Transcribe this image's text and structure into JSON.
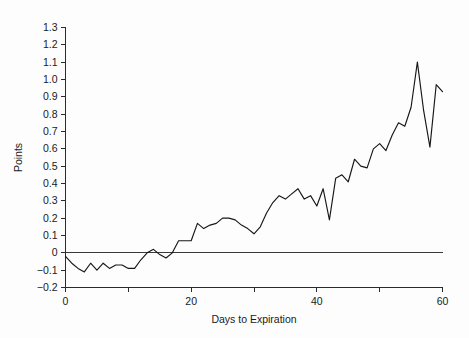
{
  "chart_data": {
    "type": "line",
    "title": "",
    "xlabel": "Days to Expiration",
    "ylabel": "Points",
    "xlim": [
      0,
      60
    ],
    "ylim": [
      -0.2,
      1.3
    ],
    "grid": false,
    "legend": null,
    "zero_reference_line": 0,
    "xticks": [
      0,
      10,
      20,
      30,
      40,
      50,
      60
    ],
    "xtick_labels": [
      "0",
      "",
      "20",
      "",
      "40",
      "",
      "60"
    ],
    "yticks": [
      -0.2,
      -0.1,
      0,
      0.1,
      0.2,
      0.3,
      0.4,
      0.5,
      0.6,
      0.7,
      0.8,
      0.9,
      1.0,
      1.1,
      1.2,
      1.3
    ],
    "ytick_labels": [
      "−0.2",
      "−0.1",
      "0",
      "0.1",
      "0.2",
      "0.3",
      "0.4",
      "0.5",
      "0.6",
      "0.7",
      "0.8",
      "0.9",
      "1.0",
      "1.1",
      "1.2",
      "1.3"
    ],
    "series": [
      {
        "name": "Points",
        "color": "#171717",
        "x": [
          0,
          1,
          2,
          3,
          4,
          5,
          6,
          7,
          8,
          9,
          10,
          11,
          12,
          13,
          14,
          15,
          16,
          17,
          18,
          19,
          20,
          21,
          22,
          23,
          24,
          25,
          26,
          27,
          28,
          29,
          30,
          31,
          32,
          33,
          34,
          35,
          36,
          37,
          38,
          39,
          40,
          41,
          42,
          43,
          44,
          45,
          46,
          47,
          48,
          49,
          50,
          51,
          52,
          53,
          54,
          55,
          56,
          57,
          58,
          59,
          60
        ],
        "values": [
          -0.02,
          -0.06,
          -0.09,
          -0.11,
          -0.06,
          -0.1,
          -0.06,
          -0.09,
          -0.07,
          -0.07,
          -0.09,
          -0.09,
          -0.04,
          0.0,
          0.02,
          -0.01,
          -0.03,
          0.0,
          0.07,
          0.07,
          0.07,
          0.17,
          0.14,
          0.16,
          0.17,
          0.2,
          0.2,
          0.19,
          0.16,
          0.14,
          0.11,
          0.15,
          0.23,
          0.29,
          0.33,
          0.31,
          0.34,
          0.37,
          0.31,
          0.33,
          0.27,
          0.37,
          0.19,
          0.43,
          0.45,
          0.41,
          0.54,
          0.5,
          0.49,
          0.6,
          0.63,
          0.59,
          0.68,
          0.75,
          0.73,
          0.84,
          1.1,
          0.82,
          0.61,
          0.97,
          0.93
        ]
      }
    ]
  },
  "figure": {
    "width": 469,
    "height": 338,
    "background": "#fdfdfd",
    "axis_color": "#2b2b2b",
    "line_color": "#171717"
  }
}
